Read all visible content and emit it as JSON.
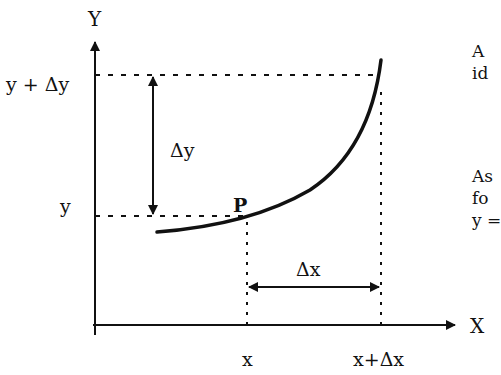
{
  "diagram": {
    "axes": {
      "x_label": "X",
      "y_label": "Y"
    },
    "y_ticks": [
      {
        "label": "y + Δy"
      },
      {
        "label": "y"
      }
    ],
    "x_ticks": [
      {
        "label": "x"
      },
      {
        "label": "x+Δx"
      }
    ],
    "point_label": "P",
    "delta_y_label": "Δy",
    "delta_x_label": "Δx",
    "side_text": [
      {
        "lines": [
          "A",
          "id"
        ]
      },
      {
        "lines": [
          "As",
          "fo",
          "y ="
        ]
      }
    ],
    "colors": {
      "ink": "#111111",
      "background": "#ffffff"
    }
  }
}
